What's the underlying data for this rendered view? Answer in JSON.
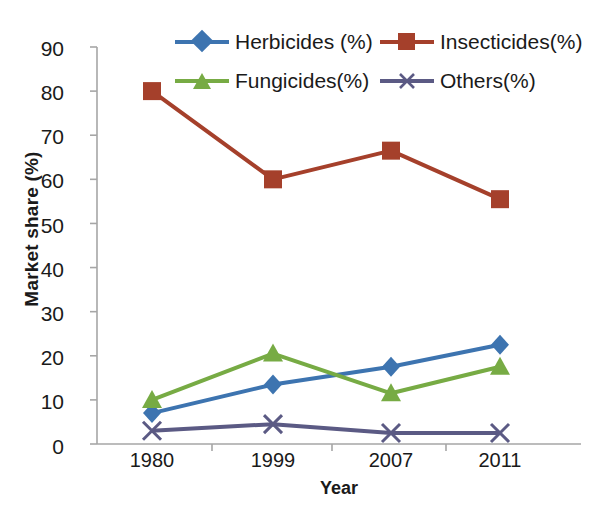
{
  "chart_data": {
    "type": "line",
    "title": "",
    "xlabel": "Year",
    "ylabel": "Market share (%)",
    "categories": [
      "1980",
      "1999",
      "2007",
      "2011"
    ],
    "x_tick_labels": [
      "1980",
      "1999",
      "2007",
      "2011"
    ],
    "y_tick_labels": [
      "0",
      "10",
      "20",
      "30",
      "40",
      "50",
      "60",
      "70",
      "80",
      "90"
    ],
    "y_ticks": [
      0,
      10,
      20,
      30,
      40,
      50,
      60,
      70,
      80,
      90
    ],
    "ylim": [
      0,
      90
    ],
    "grid": false,
    "legend_position": "top-center",
    "series": [
      {
        "name": "Herbicides (%)",
        "color": "#3d74b0",
        "marker": "diamond",
        "values": [
          7,
          13.5,
          17.5,
          22.5
        ]
      },
      {
        "name": "Insecticides(%)",
        "color": "#a5402b",
        "marker": "square",
        "values": [
          80,
          60,
          66.5,
          55.5
        ]
      },
      {
        "name": "Fungicides(%)",
        "color": "#77ab44",
        "marker": "triangle",
        "values": [
          10,
          20.5,
          11.5,
          17.5
        ]
      },
      {
        "name": "Others(%)",
        "color": "#5b5a84",
        "marker": "cross",
        "values": [
          3,
          4.5,
          2.5,
          2.5
        ]
      }
    ]
  },
  "axes": {
    "axis_line_color": "#a6a6a6",
    "text_color": "#1a1a1a"
  }
}
